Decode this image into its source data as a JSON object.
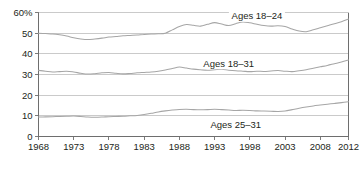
{
  "chart_data": {
    "type": "line",
    "title": "",
    "xlabel": "",
    "ylabel": "",
    "xlim": [
      1968,
      2012
    ],
    "ylim": [
      0,
      60
    ],
    "grid": true,
    "legend_position": "inline-annotations",
    "y_ticks": [
      "0",
      "10",
      "20",
      "30",
      "40",
      "50",
      "60%"
    ],
    "y_tick_values": [
      0,
      10,
      20,
      30,
      40,
      50,
      60
    ],
    "x_ticks": [
      "1968",
      "1973",
      "1978",
      "1983",
      "1988",
      "1993",
      "1998",
      "2003",
      "2008",
      "2012"
    ],
    "x_tick_values": [
      1968,
      1973,
      1978,
      1983,
      1988,
      1993,
      1998,
      2003,
      2008,
      2012
    ],
    "x": [
      1968,
      1969,
      1970,
      1971,
      1972,
      1973,
      1974,
      1975,
      1976,
      1977,
      1978,
      1979,
      1980,
      1981,
      1982,
      1983,
      1984,
      1985,
      1986,
      1987,
      1988,
      1989,
      1990,
      1991,
      1992,
      1993,
      1994,
      1995,
      1996,
      1997,
      1998,
      1999,
      2000,
      2001,
      2002,
      2003,
      2004,
      2005,
      2006,
      2007,
      2008,
      2009,
      2010,
      2011,
      2012
    ],
    "series": [
      {
        "name": "Ages 18-24",
        "label": "Ages 18–24",
        "color": "#a6a6a6",
        "label_x": 1999,
        "label_y": 57.5,
        "values": [
          50.0,
          49.8,
          49.6,
          49.2,
          48.6,
          47.8,
          47.2,
          46.9,
          47.2,
          47.6,
          48.1,
          48.4,
          48.7,
          48.9,
          49.1,
          49.4,
          49.6,
          49.7,
          50.0,
          51.6,
          53.2,
          54.2,
          53.8,
          53.4,
          54.3,
          55.1,
          54.4,
          53.7,
          54.6,
          55.4,
          55.0,
          54.3,
          53.7,
          53.4,
          53.6,
          53.2,
          52.0,
          51.0,
          50.7,
          51.6,
          52.6,
          53.6,
          54.6,
          55.5,
          56.8
        ]
      },
      {
        "name": "Ages 18-31",
        "label": "Ages 18–31",
        "color": "#a6a6a6",
        "label_x": 1995,
        "label_y": 34.5,
        "values": [
          32.0,
          31.6,
          31.2,
          31.4,
          31.6,
          31.2,
          30.6,
          30.2,
          30.4,
          30.8,
          31.0,
          30.6,
          30.3,
          30.5,
          30.8,
          31.0,
          31.2,
          31.6,
          32.2,
          32.9,
          33.6,
          33.1,
          32.6,
          32.3,
          32.1,
          32.3,
          32.5,
          32.1,
          31.8,
          31.6,
          31.4,
          31.6,
          31.5,
          31.7,
          31.9,
          31.6,
          31.4,
          31.8,
          32.3,
          33.0,
          33.7,
          34.4,
          35.2,
          36.0,
          37.0
        ]
      },
      {
        "name": "Ages 25-31",
        "label": "Ages 25–31",
        "color": "#a6a6a6",
        "label_x": 1996,
        "label_y": 5.0,
        "values": [
          9.4,
          9.5,
          9.6,
          9.7,
          9.8,
          9.9,
          9.7,
          9.4,
          9.3,
          9.4,
          9.6,
          9.7,
          9.8,
          10.0,
          10.2,
          10.6,
          11.2,
          11.9,
          12.4,
          12.8,
          13.1,
          13.2,
          13.0,
          12.9,
          13.0,
          13.2,
          13.0,
          12.8,
          12.6,
          12.7,
          12.6,
          12.4,
          12.3,
          12.2,
          12.1,
          12.3,
          13.0,
          13.7,
          14.3,
          14.8,
          15.2,
          15.6,
          16.0,
          16.4,
          16.8
        ]
      }
    ]
  },
  "chart": {
    "background_color": "#ffffff",
    "line_color": "#a6a6a6",
    "grid_color": "#b4b4b4",
    "axis_color": "#6e6e6e",
    "text_color": "#231f20"
  }
}
